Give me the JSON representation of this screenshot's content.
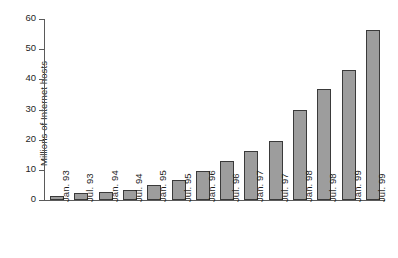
{
  "chart_data": {
    "type": "bar",
    "title": "",
    "xlabel": "",
    "ylabel": "Millions of Internet hosts",
    "ylim": [
      0,
      60
    ],
    "yticks": [
      0,
      10,
      20,
      30,
      40,
      50,
      60
    ],
    "grid": false,
    "legend": null,
    "categories": [
      "Jan. 93",
      "Jul. 93",
      "Jan. 94",
      "Jul. 94",
      "Jan. 95",
      "Jul. 95",
      "Jan. 96",
      "Jul. 96",
      "Jan. 97",
      "Jul. 97",
      "Jan. 98",
      "Jul. 98",
      "Jan. 99",
      "Jul. 99"
    ],
    "values": [
      1.3,
      2.2,
      2.5,
      3.2,
      4.9,
      6.6,
      9.5,
      13.0,
      16.1,
      19.5,
      29.7,
      36.7,
      43.2,
      56.2
    ],
    "bar_fill_color": "#9d9d9d",
    "bar_border_color": "#3a3a3a",
    "axis_color": "#5a5a5a",
    "background_color": "#ffffff"
  }
}
